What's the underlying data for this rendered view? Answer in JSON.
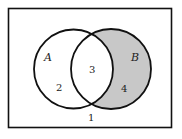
{
  "diagram": {
    "type": "venn",
    "universe_region_label": "1",
    "sets": [
      {
        "name": "A",
        "label": "A"
      },
      {
        "name": "B",
        "label": "B"
      }
    ],
    "regions": [
      {
        "id": "1",
        "label": "1",
        "description": "outside A and B"
      },
      {
        "id": "2",
        "label": "2",
        "description": "A only"
      },
      {
        "id": "3",
        "label": "3",
        "description": "A and B"
      },
      {
        "id": "4",
        "label": "4",
        "description": "B only",
        "shaded": true
      }
    ],
    "shaded_region": "4",
    "colors": {
      "shade": "#c8c8c8",
      "stroke": "#111111",
      "background": "#ffffff"
    }
  }
}
